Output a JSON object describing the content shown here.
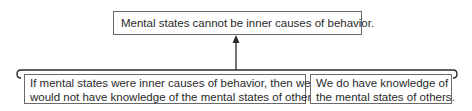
{
  "diagram": {
    "type": "argument-map",
    "conclusion": {
      "text": "Mental states cannot be inner causes of behavior."
    },
    "premises": [
      {
        "line1": "If mental states were inner causes of behavior, then we",
        "line2": "would not have knowledge of the mental states of others."
      },
      {
        "line1": "We do have knowledge of",
        "line2": "the mental states of others."
      }
    ],
    "connector": "bracket-arrow-to-conclusion",
    "colors": {
      "line": "#2a2a2a",
      "box_border": "#6a6a6a",
      "text": "#2a2a2a"
    }
  }
}
